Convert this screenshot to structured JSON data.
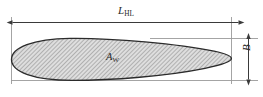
{
  "figure": {
    "type": "engineering-dimension-diagram",
    "background_color": "#ffffff",
    "line_color": "#4a4a4a",
    "outline_color": "#2b2b2b",
    "hatch_color": "#8c8c8c",
    "fill_color": "#d2d2d2",
    "label_color": "#2a2a2a",
    "labels": {
      "length": {
        "symbol": "L",
        "subscript": "HL"
      },
      "area": {
        "symbol": "A",
        "subscript": "W"
      },
      "breadth": {
        "symbol": "B",
        "subscript": ""
      }
    },
    "dimensions": {
      "horizontal": {
        "name": "L_HL",
        "orientation": "horizontal",
        "x_start": 12,
        "x_end": 239,
        "y": 22,
        "arrow_heads": "both"
      },
      "vertical": {
        "name": "B",
        "orientation": "vertical",
        "x": 248,
        "y_start": 38,
        "y_end": 80,
        "arrow_heads": "both"
      }
    },
    "shape": {
      "name": "airfoil-planform",
      "left_x": 11,
      "right_tip_x": 231,
      "top_y": 38,
      "bottom_y": 80
    }
  }
}
